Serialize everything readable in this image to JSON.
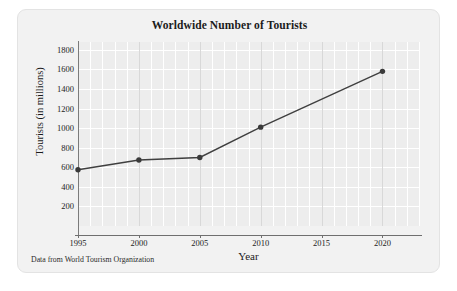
{
  "figure": {
    "title": "Worldwide Number of Tourists",
    "source_note": "Data from World Tourism Organization"
  },
  "chart_data": {
    "type": "line",
    "title": "Worldwide Number of Tourists",
    "xlabel": "Year",
    "ylabel": "Tourists (in millions)",
    "x": [
      1995,
      2000,
      2005,
      2010,
      2020
    ],
    "values": [
      575,
      675,
      700,
      1010,
      1580
    ],
    "series": [
      {
        "name": "Tourists (in millions)",
        "values": [
          575,
          675,
          700,
          1010,
          1580
        ]
      }
    ],
    "xlim": [
      1995,
      2023
    ],
    "ylim": [
      0,
      1880
    ],
    "xticks": [
      1995,
      2000,
      2005,
      2010,
      2015,
      2020
    ],
    "xtick_labels": [
      "1995",
      "2000",
      "2005",
      "2010",
      "2015",
      "2020"
    ],
    "yticks": [
      200,
      400,
      600,
      800,
      1000,
      1200,
      1400,
      1600,
      1800
    ],
    "ytick_labels": [
      "200",
      "400",
      "600",
      "800",
      "1000",
      "1200",
      "1400",
      "1600",
      "1800"
    ],
    "grid": true,
    "grid_color": "#ffffff",
    "legend": "none",
    "line_color": "#3f3f3f",
    "marker_color": "#3a3a3a",
    "marker": "circle",
    "plot_background": "#ededed"
  }
}
